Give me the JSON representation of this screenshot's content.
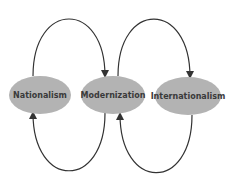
{
  "diagram": {
    "nodes": [
      {
        "id": "nationalism",
        "label": "Nationalism"
      },
      {
        "id": "modernization",
        "label": "Modernization"
      },
      {
        "id": "internationalism",
        "label": "Internationalism"
      }
    ],
    "edges": [
      {
        "from": "nationalism",
        "to": "modernization",
        "path": "top"
      },
      {
        "from": "modernization",
        "to": "nationalism",
        "path": "bottom"
      },
      {
        "from": "modernization",
        "to": "internationalism",
        "path": "top"
      },
      {
        "from": "internationalism",
        "to": "modernization",
        "path": "bottom"
      }
    ],
    "colors": {
      "node_fill": "#b3b3b3",
      "stroke": "#333333",
      "text": "#3a3a3a"
    }
  }
}
